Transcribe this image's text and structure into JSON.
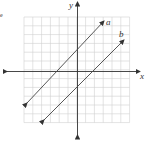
{
  "marker": "e",
  "axes": {
    "x_label": "x",
    "y_label": "y"
  },
  "grid": {
    "cells": 12,
    "range": [
      -6,
      6
    ],
    "step": 1
  },
  "lines": [
    {
      "name": "a",
      "slope": 1,
      "y_intercept": 2,
      "x_intercept": -2
    },
    {
      "name": "b",
      "slope": 1,
      "y_intercept": -2,
      "x_intercept": 2
    }
  ],
  "colors": {
    "grid": "#cccccc",
    "axis": "#333333",
    "line": "#444444"
  }
}
